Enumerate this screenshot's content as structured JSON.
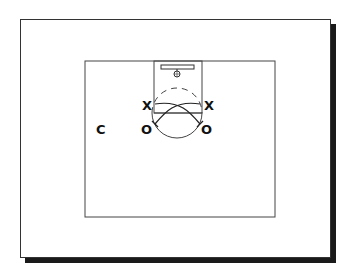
{
  "diagram": {
    "type": "basketball-half-court-play",
    "players": [
      {
        "label": "X",
        "role": "defender-left"
      },
      {
        "label": "X",
        "role": "defender-right"
      },
      {
        "label": "O",
        "role": "offense-left"
      },
      {
        "label": "O",
        "role": "offense-right"
      },
      {
        "label": "C",
        "role": "coach"
      }
    ],
    "colors": {
      "line": "#333333",
      "text": "#111111",
      "shadow": "#1a1a1a",
      "background": "#ffffff"
    }
  },
  "labels": {
    "x_left": "X",
    "x_right": "X",
    "o_left": "O",
    "o_right": "O",
    "coach": "C"
  }
}
